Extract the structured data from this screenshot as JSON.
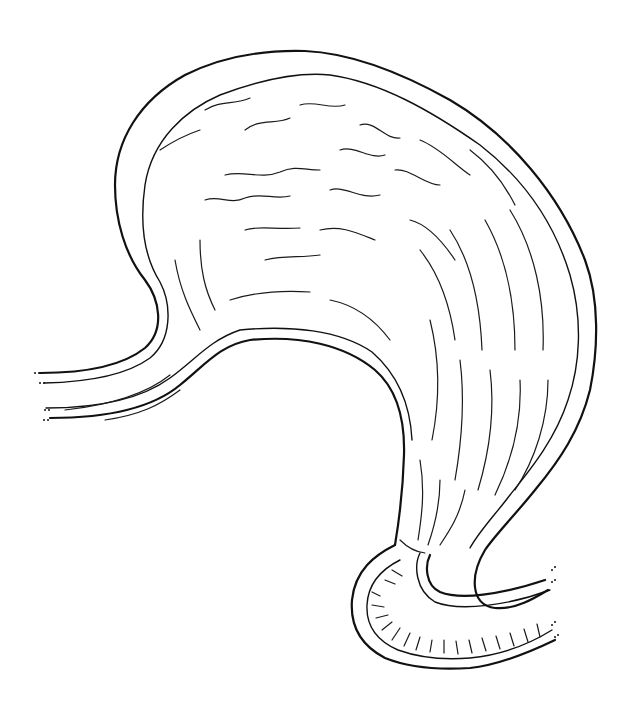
{
  "figure": {
    "subject": "Stomach line illustration",
    "style": "black line art on white",
    "regions": [
      "esophagus",
      "fundus",
      "body",
      "lesser curvature",
      "greater curvature",
      "pylorus",
      "duodenum"
    ],
    "colors": {
      "background": "#ffffff",
      "stroke": "#111111"
    }
  }
}
